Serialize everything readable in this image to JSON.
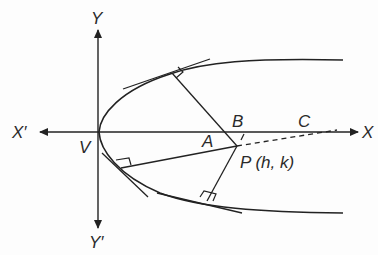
{
  "figure": {
    "type": "parabola-normals-diagram",
    "labels": {
      "y_axis_pos": "Y",
      "y_axis_neg": "Y′",
      "x_axis_pos": "X",
      "x_axis_neg": "X′",
      "vertex": "V",
      "point_a": "A",
      "point_b": "B",
      "point_c": "C",
      "point_p": "P (h, k)"
    },
    "colors": {
      "stroke": "#222222",
      "background": "#fdfdfd"
    }
  }
}
